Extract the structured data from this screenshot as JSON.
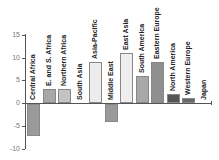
{
  "chart_data": {
    "type": "bar",
    "title": "",
    "xlabel": "",
    "ylabel": "",
    "ylim": [
      -10,
      15
    ],
    "yticks": [
      15,
      10,
      5,
      0,
      -5,
      -10
    ],
    "grid": false,
    "legend": null,
    "categories": [
      "Central Africa",
      "E. and S. Africa",
      "Northern Africa",
      "South Asia",
      "Asia-Pacific",
      "Middle East",
      "East Asia",
      "South America",
      "Eastern Europe",
      "North America",
      "Western Europe",
      "Japan"
    ],
    "values": [
      -7,
      3,
      3,
      0,
      9,
      -4,
      11,
      6,
      9,
      2,
      1,
      0
    ],
    "colors": [
      "#9a9a9a",
      "#a8a8a8",
      "#c4c4c4",
      "#dcdcdc",
      "#ececec",
      "#9a9a9a",
      "#eeeeee",
      "#a8a8a8",
      "#8f8f8f",
      "#555555",
      "#6a6a6a",
      "#ffffff"
    ]
  },
  "labels": {
    "yticks": [
      "15",
      "10",
      "5",
      "0",
      "-5",
      "-10"
    ],
    "categories": [
      "Central Africa",
      "E. and S. Africa",
      "Northern Africa",
      "South Asia",
      "Asia-Pacific",
      "Middle East",
      "East Asia",
      "South America",
      "Eastern Europe",
      "North America",
      "Western Europe",
      "Japan"
    ]
  }
}
